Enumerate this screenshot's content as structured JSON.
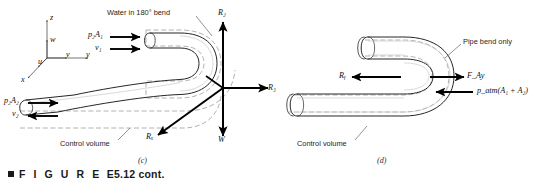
{
  "figure": {
    "caption_marker": "■",
    "caption_word": "F I G U R E",
    "caption_id": "E5.12 cont.",
    "panels": [
      {
        "letter": "(c)",
        "title": "Water in 180° bend",
        "labels": {
          "inlet_pressure_force": "p₂A₁",
          "inlet_velocity": "v₁",
          "outlet_pressure_force": "p₂A₂",
          "outlet_velocity": "v₂",
          "control_volume": "Control volume",
          "reaction_z": "R₂",
          "reaction_y": "R₃",
          "reaction_x": "Rₓ",
          "weight": "W",
          "axis_x": "x",
          "axis_y": "y",
          "axis_z": "z",
          "vel_u": "u",
          "vel_v": "v",
          "vel_w": "w"
        }
      },
      {
        "letter": "(d)",
        "title": "Pipe bend only",
        "labels": {
          "reaction_y": "Rᵧ",
          "anchoring_force": "F_Ay",
          "atmospheric_force": "p_atm(A₁ + A₂)",
          "control_volume": "Control volume"
        }
      }
    ]
  },
  "colors": {
    "ink": "#1a1a1a",
    "pipe_outline": "#2c2c2c",
    "control_volume_dash": "#9a9a9a",
    "arrow": "#000000",
    "background": "#ffffff"
  }
}
